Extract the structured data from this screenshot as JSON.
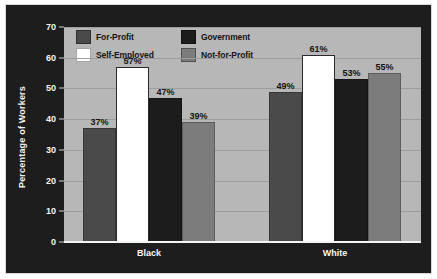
{
  "chart_data": {
    "type": "bar",
    "title": "",
    "subtitle": "",
    "xlabel": "",
    "ylabel": "Percentage of Workers",
    "categories": [
      "Black",
      "White"
    ],
    "series": [
      {
        "name": "For-Profit",
        "values": [
          37,
          49
        ],
        "color": "#4a4a4a"
      },
      {
        "name": "Self-Employed",
        "values": [
          57,
          61
        ],
        "color": "#ffffff"
      },
      {
        "name": "Government",
        "values": [
          47,
          53
        ],
        "color": "#1c1c1c"
      },
      {
        "name": "Not-for-Profit",
        "values": [
          39,
          55
        ],
        "color": "#7c7c7c"
      }
    ],
    "value_labels": [
      [
        "37%",
        "57%",
        "47%",
        "39%"
      ],
      [
        "49%",
        "61%",
        "53%",
        "55%"
      ]
    ],
    "ylim": [
      0,
      70
    ],
    "yticks": [
      0,
      10,
      20,
      30,
      40,
      50,
      60,
      70
    ],
    "ytick_labels": [
      "0",
      "10",
      "20",
      "30",
      "40",
      "50",
      "60",
      "70"
    ],
    "grid": true,
    "legend_position": "top-left-inside",
    "value_label_suffix": "%"
  },
  "style": {
    "panel_background": "#1d1d1d",
    "plot_background": "#b7b7b7",
    "gridline_color": "#9d9d9d",
    "axis_text_color": "#f4f4f4",
    "label_text_color": "#131313",
    "page_background": "#ffffff"
  }
}
